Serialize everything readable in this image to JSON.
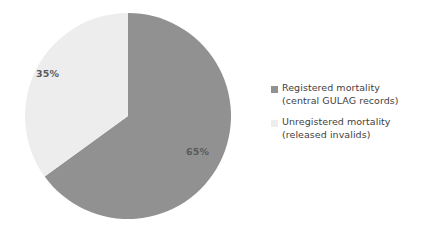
{
  "chart_data": {
    "type": "pie",
    "title": "",
    "subtitle": "",
    "categories": [
      "Registered mortality (central GULAG records)",
      "Unregistered mortality (released invalids)"
    ],
    "values": [
      65,
      35
    ],
    "unit": "%",
    "data_labels": [
      "65%",
      "35%"
    ],
    "colors": [
      "#919191",
      "#ededed"
    ],
    "legend_position": "right",
    "grid": false,
    "start_angle_deg": 0,
    "direction": "clockwise",
    "slices": [
      {
        "name": "Registered mortality",
        "detail": "(central GULAG records)",
        "value": 65,
        "label": "65%",
        "color": "#919191"
      },
      {
        "name": "Unregistered mortality",
        "detail": "(released invalids)",
        "value": 35,
        "label": "35%",
        "color": "#ededed"
      }
    ]
  },
  "pie": {
    "label_registered": "65%",
    "label_unregistered": "35%"
  },
  "legend": {
    "items": [
      {
        "line1": "Registered mortality",
        "line2": "(central GULAG records)",
        "color": "#919191"
      },
      {
        "line1": "Unregistered mortality",
        "line2": "(released invalids)",
        "color": "#ededed"
      }
    ]
  },
  "colors": {
    "registered": "#919191",
    "unregistered": "#ededed",
    "label_text": "#5a5a5a",
    "legend_text": "#3f3f3f",
    "background": "#ffffff"
  }
}
